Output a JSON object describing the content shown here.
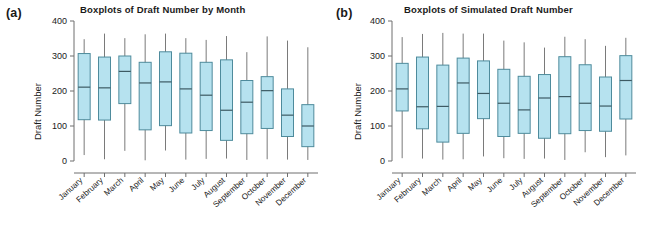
{
  "figure": {
    "panels": [
      {
        "tag": "(a)",
        "title": "Boxplots of Draft Number by Month",
        "ylabel": "Draft Number"
      },
      {
        "tag": "(b)",
        "title": "Boxplots of Simulated Draft Number",
        "ylabel": "Draft Number"
      }
    ],
    "caption_fragment": ""
  },
  "chart_data": [
    {
      "type": "box",
      "panel": "(a)",
      "title": "Boxplots of Draft Number by Month",
      "xlabel": "",
      "ylabel": "Draft Number",
      "ylim": [
        0,
        400
      ],
      "yticks": [
        0,
        100,
        200,
        300,
        400
      ],
      "ytick_labels": [
        "0",
        "100",
        "200",
        "300",
        "400"
      ],
      "grid": false,
      "legend": "none",
      "categories": [
        "January",
        "February",
        "March",
        "April",
        "May",
        "June",
        "July",
        "August",
        "September",
        "October",
        "November",
        "December"
      ],
      "boxes": [
        {
          "category": "January",
          "whisker_low": 17,
          "q1": 118,
          "median": 211,
          "q3": 307,
          "whisker_high": 348
        },
        {
          "category": "February",
          "whisker_low": 5,
          "q1": 117,
          "median": 209,
          "q3": 297,
          "whisker_high": 364
        },
        {
          "category": "March",
          "whisker_low": 29,
          "q1": 164,
          "median": 256,
          "q3": 300,
          "whisker_high": 351
        },
        {
          "category": "April",
          "whisker_low": 2,
          "q1": 89,
          "median": 223,
          "q3": 282,
          "whisker_high": 362
        },
        {
          "category": "May",
          "whisker_low": 30,
          "q1": 101,
          "median": 226,
          "q3": 312,
          "whisker_high": 364
        },
        {
          "category": "June",
          "whisker_low": 4,
          "q1": 80,
          "median": 206,
          "q3": 308,
          "whisker_high": 351
        },
        {
          "category": "July",
          "whisker_low": 6,
          "q1": 87,
          "median": 188,
          "q3": 282,
          "whisker_high": 346
        },
        {
          "category": "August",
          "whisker_low": 7,
          "q1": 59,
          "median": 145,
          "q3": 289,
          "whisker_high": 357
        },
        {
          "category": "September",
          "whisker_low": 3,
          "q1": 78,
          "median": 168,
          "q3": 230,
          "whisker_high": 311
        },
        {
          "category": "October",
          "whisker_low": 5,
          "q1": 93,
          "median": 201,
          "q3": 241,
          "whisker_high": 356
        },
        {
          "category": "November",
          "whisker_low": 4,
          "q1": 70,
          "median": 131,
          "q3": 206,
          "whisker_high": 344
        },
        {
          "category": "December",
          "whisker_low": 3,
          "q1": 41,
          "median": 100,
          "q3": 161,
          "whisker_high": 325
        }
      ]
    },
    {
      "type": "box",
      "panel": "(b)",
      "title": "Boxplots of Simulated Draft Number",
      "xlabel": "",
      "ylabel": "Draft Number",
      "ylim": [
        0,
        400
      ],
      "yticks": [
        0,
        100,
        200,
        300,
        400
      ],
      "ytick_labels": [
        "0",
        "100",
        "200",
        "300",
        "400"
      ],
      "grid": false,
      "legend": "none",
      "categories": [
        "January",
        "February",
        "March",
        "April",
        "May",
        "June",
        "July",
        "August",
        "September",
        "October",
        "November",
        "December"
      ],
      "boxes": [
        {
          "category": "January",
          "whisker_low": 8,
          "q1": 143,
          "median": 206,
          "q3": 279,
          "whisker_high": 354
        },
        {
          "category": "February",
          "whisker_low": 7,
          "q1": 92,
          "median": 155,
          "q3": 297,
          "whisker_high": 363
        },
        {
          "category": "March",
          "whisker_low": 4,
          "q1": 54,
          "median": 156,
          "q3": 274,
          "whisker_high": 366
        },
        {
          "category": "April",
          "whisker_low": 5,
          "q1": 79,
          "median": 223,
          "q3": 294,
          "whisker_high": 364
        },
        {
          "category": "May",
          "whisker_low": 13,
          "q1": 121,
          "median": 193,
          "q3": 286,
          "whisker_high": 364
        },
        {
          "category": "June",
          "whisker_low": 8,
          "q1": 70,
          "median": 165,
          "q3": 262,
          "whisker_high": 344
        },
        {
          "category": "July",
          "whisker_low": 6,
          "q1": 79,
          "median": 146,
          "q3": 242,
          "whisker_high": 339
        },
        {
          "category": "August",
          "whisker_low": 7,
          "q1": 65,
          "median": 180,
          "q3": 247,
          "whisker_high": 324
        },
        {
          "category": "September",
          "whisker_low": 3,
          "q1": 78,
          "median": 184,
          "q3": 298,
          "whisker_high": 355
        },
        {
          "category": "October",
          "whisker_low": 25,
          "q1": 87,
          "median": 165,
          "q3": 275,
          "whisker_high": 348
        },
        {
          "category": "November",
          "whisker_low": 11,
          "q1": 85,
          "median": 157,
          "q3": 240,
          "whisker_high": 329
        },
        {
          "category": "December",
          "whisker_low": 16,
          "q1": 120,
          "median": 230,
          "q3": 301,
          "whisker_high": 352
        }
      ]
    }
  ],
  "style": {
    "box_fill": "#b6e2ef",
    "box_stroke": "#4e8b9c",
    "median_stroke": "#3d5a63",
    "whisker_stroke": "#7a7a7a",
    "axis_stroke": "#6e6e6e",
    "text_color": "#1a1a1a",
    "background": "#ffffff"
  }
}
